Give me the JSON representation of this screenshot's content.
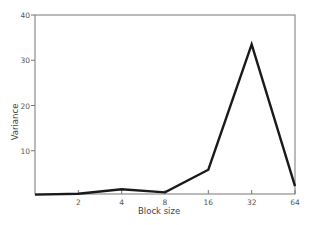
{
  "chart_data": {
    "type": "line",
    "title": "",
    "xlabel": "Block size",
    "ylabel": "Variance",
    "categories": [
      "1",
      "2",
      "4",
      "8",
      "16",
      "32",
      "64"
    ],
    "x_tick_labels": [
      "2",
      "4",
      "8",
      "16",
      "32",
      "64"
    ],
    "y_ticks": [
      10,
      20,
      30,
      40
    ],
    "ylim": [
      0,
      40
    ],
    "grid": false,
    "legend": null,
    "series": [
      {
        "name": "Variance",
        "values": [
          0.3,
          0.5,
          1.5,
          0.8,
          5.8,
          33.5,
          2.2
        ]
      }
    ],
    "line_color": "#1a1a1a"
  }
}
